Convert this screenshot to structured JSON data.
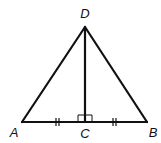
{
  "diagram": {
    "type": "geometry",
    "colors": {
      "stroke": "#111111",
      "background": "#ffffff"
    },
    "points": {
      "A": {
        "label": "A",
        "x": 22,
        "y": 122,
        "label_x": 14,
        "label_y": 137
      },
      "B": {
        "label": "B",
        "x": 147,
        "y": 122,
        "label_x": 153,
        "label_y": 137
      },
      "C": {
        "label": "C",
        "x": 85,
        "y": 122,
        "label_x": 85,
        "label_y": 138
      },
      "D": {
        "label": "D",
        "x": 85,
        "y": 27,
        "label_x": 85,
        "label_y": 18
      }
    },
    "segments": [
      "AB",
      "AD",
      "BD",
      "DC"
    ],
    "marks": {
      "right_angle_at": "C",
      "congruent_segments": [
        "AC",
        "CB"
      ],
      "tick_count": 2
    }
  }
}
